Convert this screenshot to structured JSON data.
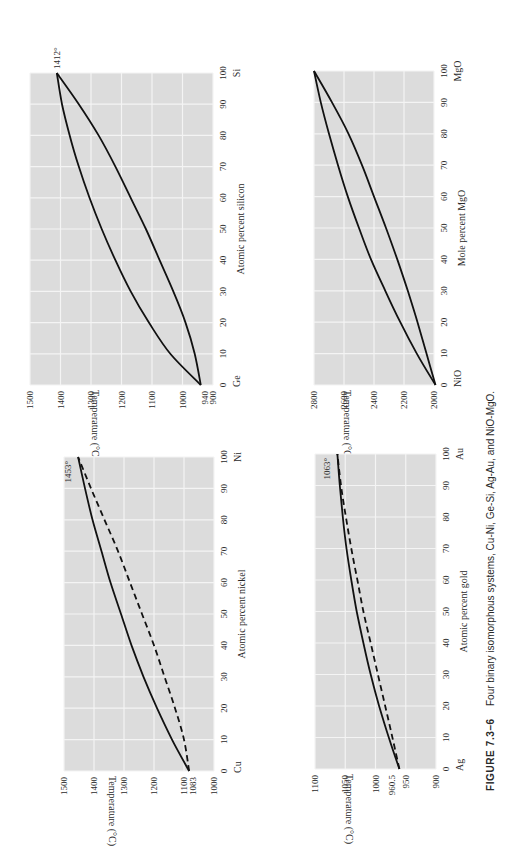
{
  "figure": {
    "caption_label": "FIGURE 7.3–6",
    "caption_text": "Four binary isomorphous systems, Cu-Ni, Ge-Si, Ag-Au, and NiO-MgO.",
    "orientation": "rotated 90° counter-clockwise",
    "colors": {
      "plot_bg": "#dcdcdc",
      "grid": "#f4f4f4",
      "curve": "#111111"
    }
  },
  "chart_data": [
    {
      "id": "ge-si",
      "type": "line",
      "title": "Ge-Si",
      "xlabel": "Atomic percent silicon",
      "ylabel": "Temperature (°C)",
      "left_element": "Ge",
      "right_element": "Si",
      "x_ticks": [
        0,
        10,
        20,
        30,
        40,
        50,
        60,
        70,
        80,
        90,
        100
      ],
      "y_ticks": [
        900,
        1000,
        1100,
        1200,
        1300,
        1400,
        1500
      ],
      "ylim": [
        900,
        1500
      ],
      "grid": true,
      "annotations": [
        {
          "text": "940",
          "x": 0,
          "y": 940,
          "kind": "axis-label"
        },
        {
          "text": "1412°",
          "x": 100,
          "y": 1412
        }
      ],
      "series": [
        {
          "name": "Liquidus",
          "style": "solid",
          "x": [
            0,
            10,
            20,
            30,
            40,
            50,
            60,
            70,
            80,
            90,
            100
          ],
          "y": [
            940,
            1040,
            1110,
            1170,
            1220,
            1265,
            1305,
            1340,
            1370,
            1395,
            1412
          ]
        },
        {
          "name": "Solidus",
          "style": "solid",
          "x": [
            0,
            10,
            20,
            30,
            40,
            50,
            60,
            70,
            80,
            90,
            100
          ],
          "y": [
            940,
            960,
            990,
            1030,
            1075,
            1120,
            1170,
            1220,
            1275,
            1340,
            1412
          ]
        }
      ],
      "frame": {
        "tLeft": 1500,
        "tRight": 900,
        "xAt_tLeft": 30,
        "xAt_tRight": 213,
        "yAt0": 385,
        "yAt100": 73
      }
    },
    {
      "id": "nio-mgo",
      "type": "line",
      "title": "NiO-MgO",
      "xlabel": "Mole percent MgO",
      "ylabel": "Temperature (°C)",
      "left_element": "NiO",
      "right_element": "MgO",
      "x_ticks": [
        0,
        10,
        20,
        30,
        40,
        50,
        60,
        70,
        80,
        90,
        100
      ],
      "y_ticks": [
        2000,
        2200,
        2400,
        2600,
        2800
      ],
      "ylim": [
        2000,
        2800
      ],
      "grid": true,
      "annotations": [],
      "series": [
        {
          "name": "Liquidus",
          "style": "solid",
          "x": [
            0,
            10,
            20,
            30,
            40,
            50,
            60,
            70,
            80,
            90,
            100
          ],
          "y": [
            1990,
            2115,
            2225,
            2325,
            2420,
            2500,
            2575,
            2640,
            2700,
            2755,
            2800
          ]
        },
        {
          "name": "Solidus",
          "style": "solid",
          "x": [
            0,
            10,
            20,
            30,
            40,
            50,
            60,
            70,
            80,
            90,
            100
          ],
          "y": [
            1990,
            2050,
            2110,
            2175,
            2245,
            2320,
            2400,
            2480,
            2570,
            2680,
            2800
          ]
        }
      ],
      "frame": {
        "tLeft": 2800,
        "tRight": 2000,
        "xAt_tLeft": 314,
        "xAt_tRight": 434,
        "yAt0": 385,
        "yAt100": 71
      }
    },
    {
      "id": "cu-ni",
      "type": "line",
      "title": "Cu-Ni",
      "xlabel": "Atomic percent nickel",
      "ylabel": "Temperature (°C)",
      "left_element": "Cu",
      "right_element": "Ni",
      "x_ticks": [
        0,
        10,
        20,
        30,
        40,
        50,
        60,
        70,
        80,
        90,
        100
      ],
      "y_ticks": [
        1000,
        1100,
        1200,
        1300,
        1400,
        1500
      ],
      "ylim": [
        1000,
        1500
      ],
      "grid": true,
      "annotations": [
        {
          "text": "1083",
          "x": 0,
          "y": 1083,
          "kind": "axis-label"
        },
        {
          "text": "1453°",
          "x": 100,
          "y": 1453
        }
      ],
      "series": [
        {
          "name": "Liquidus",
          "style": "solid",
          "x": [
            0,
            10,
            20,
            30,
            40,
            50,
            60,
            70,
            80,
            90,
            100
          ],
          "y": [
            1083,
            1140,
            1190,
            1235,
            1275,
            1310,
            1345,
            1375,
            1405,
            1430,
            1453
          ]
        },
        {
          "name": "Solidus",
          "style": "dashed",
          "x": [
            0,
            10,
            20,
            30,
            40,
            50,
            60,
            70,
            80,
            90,
            100
          ],
          "y": [
            1083,
            1100,
            1130,
            1165,
            1200,
            1240,
            1280,
            1320,
            1365,
            1410,
            1453
          ]
        }
      ],
      "frame": {
        "tLeft": 1500,
        "tRight": 1000,
        "xAt_tLeft": 64,
        "xAt_tRight": 214,
        "yAt0": 771,
        "yAt100": 457
      }
    },
    {
      "id": "ag-au",
      "type": "line",
      "title": "Ag-Au",
      "xlabel": "Atomic percent gold",
      "ylabel": "Temperature (°C)",
      "left_element": "Ag",
      "right_element": "Au",
      "x_ticks": [
        0,
        10,
        20,
        30,
        40,
        50,
        60,
        70,
        80,
        90,
        100
      ],
      "y_ticks": [
        900,
        950,
        1000,
        1050,
        1100
      ],
      "ylim": [
        900,
        1100
      ],
      "grid": true,
      "annotations": [
        {
          "text": "960.5",
          "x": 0,
          "y": 960.5,
          "kind": "axis-label"
        },
        {
          "text": "1063°",
          "x": 100,
          "y": 1063
        }
      ],
      "series": [
        {
          "name": "Liquidus",
          "style": "solid",
          "x": [
            0,
            10,
            20,
            30,
            40,
            50,
            60,
            70,
            80,
            90,
            100
          ],
          "y": [
            960.5,
            978,
            994,
            1008,
            1020,
            1031,
            1040,
            1048,
            1054,
            1059,
            1063
          ]
        },
        {
          "name": "Solidus",
          "style": "dashed",
          "x": [
            0,
            10,
            20,
            30,
            40,
            50,
            60,
            70,
            80,
            90,
            100
          ],
          "y": [
            960.5,
            972,
            984,
            996,
            1008,
            1020,
            1030,
            1040,
            1049,
            1057,
            1063
          ]
        }
      ],
      "frame": {
        "tLeft": 1100,
        "tRight": 900,
        "xAt_tLeft": 315,
        "xAt_tRight": 436,
        "yAt0": 769,
        "yAt100": 454
      }
    }
  ]
}
